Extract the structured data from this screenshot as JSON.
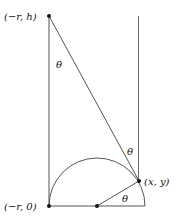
{
  "diagram": {
    "labels": {
      "top_point": "(−r, h)",
      "bottom_left_point": "(−r, 0)",
      "arc_point": "(x, y)",
      "angle_top": "θ",
      "angle_right": "θ",
      "angle_center": "θ"
    },
    "colors": {
      "line": "#555555",
      "dot": "#111111",
      "text": "#111111"
    }
  }
}
